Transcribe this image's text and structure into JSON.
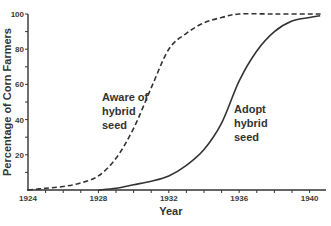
{
  "chart_data": {
    "type": "line",
    "title": "",
    "xlabel": "Year",
    "ylabel": "Percentage of Corn Farmers",
    "xlim": [
      1924,
      1940.8
    ],
    "ylim": [
      0,
      100
    ],
    "x_ticks": [
      1924,
      1928,
      1932,
      1936,
      1940
    ],
    "y_ticks": [
      20,
      40,
      60,
      80,
      100
    ],
    "grid": false,
    "legend": null,
    "series": [
      {
        "name": "Aware of hybrid seed",
        "style": "dashed",
        "x": [
          1924,
          1925,
          1926,
          1927,
          1928,
          1929,
          1930,
          1931,
          1932,
          1933,
          1934,
          1935,
          1936,
          1938,
          1940,
          1940.7
        ],
        "values": [
          0,
          1,
          2,
          4,
          8,
          18,
          35,
          58,
          80,
          89,
          95,
          98,
          100,
          100,
          100,
          100
        ]
      },
      {
        "name": "Adopt hybrid seed",
        "style": "solid",
        "x": [
          1928,
          1929,
          1930,
          1931,
          1932,
          1933,
          1934,
          1935,
          1936,
          1937,
          1938,
          1939,
          1940,
          1940.6
        ],
        "values": [
          0,
          1,
          3,
          5,
          8,
          14,
          23,
          38,
          62,
          79,
          90,
          96,
          98,
          99
        ]
      }
    ],
    "annotations": [
      {
        "text": [
          "Aware of",
          "hybrid",
          "seed"
        ],
        "near_series": "Aware of hybrid seed"
      },
      {
        "text": [
          "Adopt",
          "hybrid",
          "seed"
        ],
        "near_series": "Adopt hybrid seed"
      }
    ]
  },
  "labels": {
    "ylabel": "Percentage of Corn Farmers",
    "xlabel": "Year",
    "aware": [
      "Aware of",
      "hybrid",
      "seed"
    ],
    "adopt": [
      "Adopt",
      "hybrid",
      "seed"
    ]
  }
}
